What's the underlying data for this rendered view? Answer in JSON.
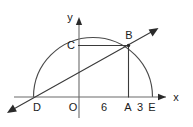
{
  "figure": {
    "kind": "geometry-diagram",
    "background_color": "#ffffff",
    "line_color": "#3a3a3a",
    "axis_color": "#6b6b6b",
    "arc_color": "#4a4a4a",
    "label_color": "#1b1b1b"
  },
  "axes": {
    "y_axis_label": "y",
    "x_axis_label": "x",
    "origin_label": "O"
  },
  "points": [
    {
      "id": "D",
      "label": "D",
      "role": "left-endpoint-of-diameter"
    },
    {
      "id": "O",
      "label": "O",
      "role": "origin"
    },
    {
      "id": "A",
      "label": "A",
      "role": "foot-of-perpendicular-from-B"
    },
    {
      "id": "E",
      "label": "E",
      "role": "right-endpoint-of-diameter"
    },
    {
      "id": "B",
      "label": "B",
      "role": "point-on-semicircle"
    },
    {
      "id": "C",
      "label": "C",
      "role": "point-left-of-B-on-horizontal"
    }
  ],
  "segment_labels": [
    {
      "id": "OA",
      "label": "6",
      "role": "length-from-O-to-A"
    },
    {
      "id": "AE",
      "label": "3",
      "role": "length-from-A-to-E"
    }
  ],
  "segments": [
    {
      "id": "ray-DB",
      "from": "D",
      "to": "B",
      "arrow": "both-ends-extended"
    },
    {
      "id": "segment-CB",
      "from": "C",
      "to": "B",
      "arrow": "none"
    },
    {
      "id": "segment-BA",
      "from": "B",
      "to": "A",
      "arrow": "none"
    }
  ],
  "arc": {
    "id": "semicircle-DE",
    "shape": "semicircle",
    "diameter_endpoints": [
      "D",
      "E"
    ]
  }
}
